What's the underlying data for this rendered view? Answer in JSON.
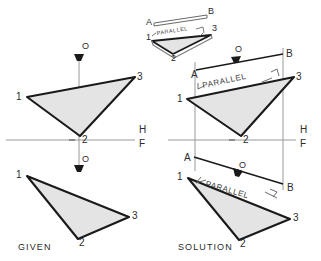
{
  "figure": {
    "background_color": "#ffffff",
    "ink_color": "#1a1a1a",
    "thin_line_color": "#9a9a9a",
    "face_fill_color": "#e4e4e4",
    "panels": [
      {
        "id": "given",
        "caption": "GIVEN",
        "caption_pos": {
          "x": 18,
          "y": 250
        }
      },
      {
        "id": "solution",
        "caption": "SOLUTION",
        "caption_pos": {
          "x": 178,
          "y": 250
        }
      }
    ],
    "fold_line_labels": [
      {
        "text": "H",
        "x": 139,
        "y": 133
      },
      {
        "text": "F",
        "x": 139,
        "y": 147
      },
      {
        "text": "H",
        "x": 300,
        "y": 133
      },
      {
        "text": "F",
        "x": 300,
        "y": 147
      }
    ],
    "vertex_labels": [
      {
        "text": "1",
        "x": 16,
        "y": 100,
        "panel": "given",
        "view": "top"
      },
      {
        "text": "3",
        "x": 137,
        "y": 80,
        "panel": "given",
        "view": "top"
      },
      {
        "text": "2",
        "x": 82,
        "y": 143,
        "panel": "given",
        "view": "top"
      },
      {
        "text": "1",
        "x": 16,
        "y": 178,
        "panel": "given",
        "view": "front"
      },
      {
        "text": "3",
        "x": 132,
        "y": 219,
        "panel": "given",
        "view": "front"
      },
      {
        "text": "2",
        "x": 79,
        "y": 246,
        "panel": "given",
        "view": "front"
      },
      {
        "text": "1",
        "x": 177,
        "y": 102,
        "panel": "solution",
        "view": "top"
      },
      {
        "text": "3",
        "x": 296,
        "y": 80,
        "panel": "solution",
        "view": "top"
      },
      {
        "text": "2",
        "x": 243,
        "y": 143,
        "panel": "solution",
        "view": "top"
      },
      {
        "text": "1",
        "x": 177,
        "y": 180,
        "panel": "solution",
        "view": "front"
      },
      {
        "text": "3",
        "x": 293,
        "y": 221,
        "panel": "solution",
        "view": "front"
      },
      {
        "text": "2",
        "x": 240,
        "y": 247,
        "panel": "solution",
        "view": "front"
      },
      {
        "text": "1",
        "x": 146,
        "y": 40,
        "panel": "pictorial",
        "view": "pictorial"
      },
      {
        "text": "3",
        "x": 212,
        "y": 31,
        "panel": "pictorial",
        "view": "pictorial"
      },
      {
        "text": "2",
        "x": 171,
        "y": 56,
        "panel": "pictorial",
        "view": "pictorial"
      }
    ],
    "point_labels": [
      {
        "text": "O",
        "x": 82,
        "y": 49,
        "panel": "given",
        "view": "top"
      },
      {
        "text": "O",
        "x": 82,
        "y": 159,
        "panel": "given",
        "view": "front"
      },
      {
        "text": "O",
        "x": 239,
        "y": 52,
        "panel": "solution",
        "view": "top"
      },
      {
        "text": "O",
        "x": 241,
        "y": 165,
        "panel": "solution",
        "view": "front"
      }
    ],
    "line_endpoint_labels": [
      {
        "text": "A",
        "x": 192,
        "y": 76,
        "panel": "solution",
        "view": "top"
      },
      {
        "text": "B",
        "x": 286,
        "y": 56,
        "panel": "solution",
        "view": "top"
      },
      {
        "text": "A",
        "x": 186,
        "y": 162,
        "panel": "solution",
        "view": "front"
      },
      {
        "text": "B",
        "x": 287,
        "y": 189,
        "panel": "solution",
        "view": "front"
      },
      {
        "text": "A",
        "x": 147,
        "y": 18,
        "panel": "pictorial",
        "view": "pictorial"
      },
      {
        "text": "B",
        "x": 208,
        "y": 12,
        "panel": "pictorial",
        "view": "pictorial"
      }
    ],
    "annotations": [
      {
        "text": "PARALLEL",
        "x": 200,
        "y": 82,
        "rotation": -12,
        "size": "large",
        "panel": "solution",
        "view": "top"
      },
      {
        "text": "PARALLEL",
        "x": 203,
        "y": 188,
        "rotation": 14,
        "size": "large",
        "panel": "solution",
        "view": "front"
      },
      {
        "text": "PARALLEL",
        "x": 153,
        "y": 33,
        "rotation": -10,
        "size": "small",
        "panel": "pictorial",
        "view": "pictorial"
      }
    ]
  }
}
